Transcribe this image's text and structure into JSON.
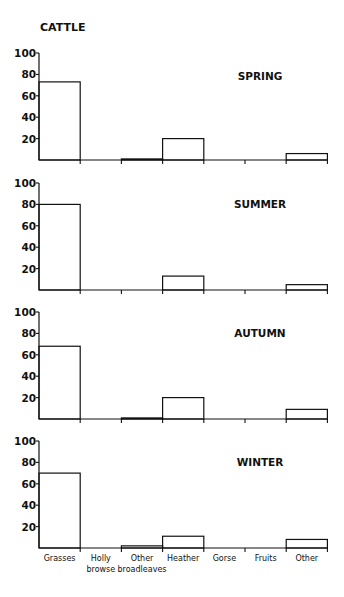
{
  "chart_data": {
    "type": "bar",
    "title": "CATTLE",
    "xlabel": "",
    "ylabel": "",
    "ylim": [
      0,
      100
    ],
    "yticks": [
      20,
      40,
      60,
      80,
      100
    ],
    "grid": false,
    "categories": [
      "Grasses",
      "Holly browse",
      "Other broadleaves",
      "Heather",
      "Gorse",
      "Fruits",
      "Other"
    ],
    "category_labels": [
      [
        "Grasses"
      ],
      [
        "Holly",
        "browse"
      ],
      [
        "Other",
        "broadleaves"
      ],
      [
        "Heather"
      ],
      [
        "Gorse"
      ],
      [
        "Fruits"
      ],
      [
        "Other"
      ]
    ],
    "panels": [
      {
        "name": "SPRING",
        "values": [
          73,
          0,
          1,
          20,
          0,
          0,
          6
        ]
      },
      {
        "name": "SUMMER",
        "values": [
          80,
          0,
          0,
          13,
          0,
          0,
          5
        ]
      },
      {
        "name": "AUTUMN",
        "values": [
          68,
          0,
          1,
          20,
          0,
          0,
          9
        ]
      },
      {
        "name": "WINTER",
        "values": [
          70,
          0,
          2,
          11,
          0,
          0,
          8
        ]
      }
    ]
  }
}
